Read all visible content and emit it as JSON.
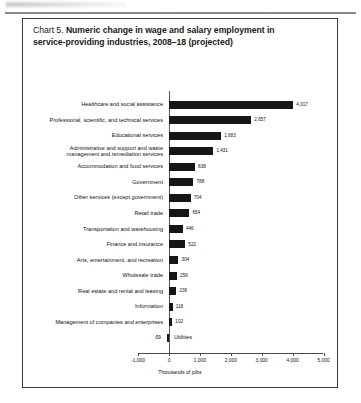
{
  "figure": {
    "label": "Chart 5.",
    "title_line1": "Numeric change in wage and salary employment in",
    "title_line2": "service-providing industries, 2008–18 (projected)"
  },
  "chart_data": {
    "type": "bar",
    "orientation": "horizontal",
    "title": "Chart 5. Numeric change in wage and salary employment in service-providing industries, 2008–18 (projected)",
    "xlabel": "Thousands of jobs",
    "ylabel": "",
    "xlim": [
      -1000,
      5000
    ],
    "grid": false,
    "legend": null,
    "bar_color": "#161616",
    "tick_labels": [
      "-1,000",
      "0",
      "1,000",
      "2,000",
      "3,000",
      "4,000",
      "5,000"
    ],
    "ticks": [
      -1000,
      0,
      1000,
      2000,
      3000,
      4000,
      5000
    ],
    "categories": [
      "Healthcare and social assistance",
      "Professional, scientific, and technical services",
      "Educational services",
      "Administrative and support and waste management and remediation services",
      "Accommodation and food services",
      "Government",
      "Other services (except government)",
      "Retail trade",
      "Transportation and warehousing",
      "Finance and insurance",
      "Arts, entertainment, and recreation",
      "Wholesale trade",
      "Real estate and rental and leasing",
      "Information",
      "Management of companies and enterprises",
      "Utilities"
    ],
    "values": [
      4017,
      2657,
      1683,
      1431,
      838,
      788,
      704,
      654,
      446,
      522,
      304,
      256,
      236,
      118,
      102,
      -59
    ],
    "value_labels": [
      "4,017",
      "2,657",
      "1,683",
      "1,431",
      "838",
      "788",
      "704",
      "654",
      "446",
      "522",
      "304",
      "256",
      "236",
      "118",
      "102",
      "-59"
    ]
  },
  "rows": [
    {
      "cat": "Healthcare and social assistance",
      "cat2": "",
      "value_label": "4,017",
      "value": 4017
    },
    {
      "cat": "Professional, scientific, and technical services",
      "cat2": "",
      "value_label": "2,657",
      "value": 2657
    },
    {
      "cat": "Educational services",
      "cat2": "",
      "value_label": "1,683",
      "value": 1683
    },
    {
      "cat": "Administrative and support and waste",
      "cat2": "management and remediation services",
      "value_label": "1,431",
      "value": 1431
    },
    {
      "cat": "Accommodation and food services",
      "cat2": "",
      "value_label": "838",
      "value": 838
    },
    {
      "cat": "Government",
      "cat2": "",
      "value_label": "788",
      "value": 788
    },
    {
      "cat": "Other services (except government)",
      "cat2": "",
      "value_label": "704",
      "value": 704
    },
    {
      "cat": "Retail trade",
      "cat2": "",
      "value_label": "654",
      "value": 654
    },
    {
      "cat": "Transportation and warehousing",
      "cat2": "",
      "value_label": "446",
      "value": 446
    },
    {
      "cat": "Finance and insurance",
      "cat2": "",
      "value_label": "522",
      "value": 522
    },
    {
      "cat": "Arts, entertainment, and recreation",
      "cat2": "",
      "value_label": "304",
      "value": 304
    },
    {
      "cat": "Wholesale trade",
      "cat2": "",
      "value_label": "256",
      "value": 256
    },
    {
      "cat": "Real estate and rental and leasing",
      "cat2": "",
      "value_label": "236",
      "value": 236
    },
    {
      "cat": "Information",
      "cat2": "",
      "value_label": "118",
      "value": 118
    },
    {
      "cat": "Management of companies and enterprises",
      "cat2": "",
      "value_label": "102",
      "value": 102
    },
    {
      "cat": "Utilities",
      "cat2": "",
      "value_label": "-59",
      "value": -59
    }
  ],
  "axis": {
    "x_title": "Thousands of jobs"
  }
}
